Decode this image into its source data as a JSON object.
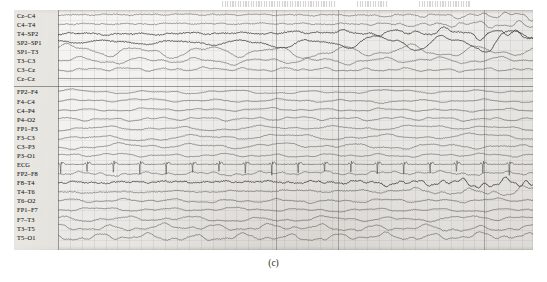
{
  "figure": {
    "caption": "(c)",
    "panel_label": "(c)"
  },
  "header_notes": [
    {
      "text": "",
      "x_pct": 40,
      "width_pct": 22
    },
    {
      "text": "",
      "x_pct": 66,
      "width_pct": 6
    },
    {
      "text": "",
      "x_pct": 78,
      "width_pct": 10
    }
  ],
  "chart_data": {
    "type": "line",
    "title": "",
    "subtitle": "",
    "xlabel": "",
    "ylabel": "",
    "grid": true,
    "legend_position": "left-gutter",
    "recording": "EEG multichannel strip chart",
    "channel_count": 24,
    "groups": [
      {
        "name": "bipolar-transverse-montage",
        "channels": [
          "Cz–C4",
          "C4–T4",
          "T4–SP2",
          "SP2–SP1",
          "SP1–T3",
          "T3–C3",
          "C3–Cz",
          "Cz–Cz"
        ]
      },
      {
        "name": "bipolar-longitudinal-montage",
        "channels": [
          "FP2–F4",
          "F4–C4",
          "C4–P4",
          "P4–O2",
          "FP1–F3",
          "F3–C3",
          "C3–P3",
          "P3–O1",
          "ECG",
          "FP2–F8",
          "F8–T4",
          "T4–T6",
          "T6–O2",
          "FP1–F7",
          "F7–T3",
          "T3–T5",
          "T5–O1"
        ]
      }
    ],
    "channels": [
      {
        "label": "Cz–C4",
        "group": 0,
        "morphology": "low-amplitude mixed background, increasing fast activity to the right"
      },
      {
        "label": "C4–T4",
        "group": 0,
        "morphology": "low-amplitude background with right-sided rhythmic buildup"
      },
      {
        "label": "T4–SP2",
        "group": 0,
        "morphology": "rhythmic theta evolving into high-amplitude spike-wave discharges on the right"
      },
      {
        "label": "SP2–SP1",
        "group": 0,
        "morphology": "large-amplitude rhythmic delta/theta throughout, maximal right half"
      },
      {
        "label": "SP1–T3",
        "group": 0,
        "morphology": "large-amplitude rhythmic delta, sustained"
      },
      {
        "label": "T3–C3",
        "group": 0,
        "morphology": "moderate-amplitude rhythmic theta"
      },
      {
        "label": "C3–Cz",
        "group": 0,
        "morphology": "low-amplitude mixed background"
      },
      {
        "label": "Cz–Cz",
        "group": 0,
        "morphology": "flat reference channel, near isoelectric"
      },
      {
        "label": "FP2–F4",
        "group": 1,
        "morphology": "low-amplitude background with slow drift"
      },
      {
        "label": "F4–C4",
        "group": 1,
        "morphology": "low-amplitude background"
      },
      {
        "label": "C4–P4",
        "group": 1,
        "morphology": "low-amplitude background"
      },
      {
        "label": "P4–O2",
        "group": 1,
        "morphology": "low-amplitude background with occipital rhythm"
      },
      {
        "label": "FP1–F3",
        "group": 1,
        "morphology": "low-amplitude background, intermittent slow waves"
      },
      {
        "label": "F3–C3",
        "group": 1,
        "morphology": "moderate slow-wave activity, left frontal"
      },
      {
        "label": "C3–P3",
        "group": 1,
        "morphology": "intermittent sharp transients"
      },
      {
        "label": "P3–O1",
        "group": 1,
        "morphology": "low-amplitude background"
      },
      {
        "label": "ECG",
        "group": 1,
        "morphology": "regular QRS complexes, approximately 1.2 Hz"
      },
      {
        "label": "FP2–F8",
        "group": 1,
        "morphology": "low-amplitude background with muscle artifact"
      },
      {
        "label": "F8–T4",
        "group": 1,
        "morphology": "rhythmic buildup with high-frequency discharge on the right half"
      },
      {
        "label": "T4–T6",
        "group": 1,
        "morphology": "rhythmic theta with right-sided evolution"
      },
      {
        "label": "T6–O2",
        "group": 1,
        "morphology": "low-amplitude background"
      },
      {
        "label": "FP1–F7",
        "group": 1,
        "morphology": "low-amplitude background"
      },
      {
        "label": "F7–T3",
        "group": 1,
        "morphology": "moderate rhythmic activity"
      },
      {
        "label": "T3–T5",
        "group": 1,
        "morphology": "moderate-amplitude sharp and slow waves"
      },
      {
        "label": "T5–O1",
        "group": 1,
        "morphology": "moderate-amplitude sharp waves, periodic"
      }
    ],
    "time_markers_x_pct": [
      42,
      54,
      82
    ]
  }
}
